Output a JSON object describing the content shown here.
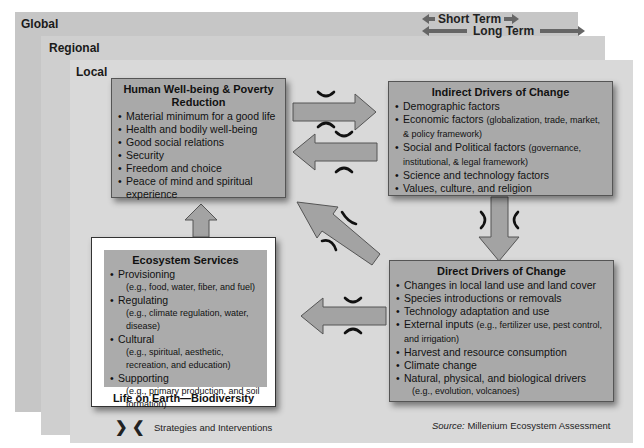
{
  "layers": {
    "global": "Global",
    "regional": "Regional",
    "local": "Local"
  },
  "time_scale": {
    "short": "Short Term",
    "long": "Long Term"
  },
  "human_wellbeing": {
    "title": "Human Well-being & Poverty Reduction",
    "items": [
      "Material minimum for a good life",
      "Health and bodily well-being",
      "Good social relations",
      "Security",
      "Freedom and choice",
      "Peace of mind and spiritual experience"
    ]
  },
  "indirect_drivers": {
    "title": "Indirect Drivers of Change",
    "items": [
      {
        "main": "Demographic factors",
        "detail": ""
      },
      {
        "main": "Economic factors",
        "detail": "(globalization, trade, market, & policy framework)"
      },
      {
        "main": "Social and Political factors",
        "detail": "(governance, institutional, & legal framework)"
      },
      {
        "main": "Science and technology factors",
        "detail": ""
      },
      {
        "main": "Values, culture, and religion",
        "detail": ""
      }
    ]
  },
  "direct_drivers": {
    "title": "Direct Drivers of Change",
    "items": [
      {
        "main": "Changes in local land use and land cover",
        "detail": ""
      },
      {
        "main": "Species introductions or removals",
        "detail": ""
      },
      {
        "main": "Technology adaptation and use",
        "detail": ""
      },
      {
        "main": "External inputs",
        "detail": "(e.g., fertilizer use, pest control, and irrigation)"
      },
      {
        "main": "Harvest and resource consumption",
        "detail": ""
      },
      {
        "main": "Climate change",
        "detail": ""
      },
      {
        "main": "Natural, physical, and biological drivers",
        "detail": "(e.g., evolution, volcanoes)"
      }
    ]
  },
  "ecosystem_services": {
    "title": "Ecosystem Services",
    "items": [
      {
        "main": "Provisioning",
        "detail": "(e.g., food, water, fiber, and fuel)"
      },
      {
        "main": "Regulating",
        "detail": "(e.g., climate regulation, water, disease)"
      },
      {
        "main": "Cultural",
        "detail": "(e.g., spiritual, aesthetic, recreation, and education)"
      },
      {
        "main": "Supporting",
        "detail": "(e.g., primary production, and soil formation)"
      }
    ]
  },
  "biodiversity_frame": {
    "label": "Life on Earth—Biodiversity"
  },
  "legend": {
    "glyphs": "❯❮",
    "label": "Strategies and Interventions"
  },
  "source": {
    "prefix": "Source:",
    "text": " Millenium Ecosystem Assessment"
  },
  "colors": {
    "global_layer": "#c6c6c6",
    "regional_layer": "#cfcfcf",
    "local_layer": "#d9d9d9",
    "box_fill": "#a9a9a9",
    "arrow_fill": "#a3a3a3",
    "arrow_stroke": "#555555"
  }
}
